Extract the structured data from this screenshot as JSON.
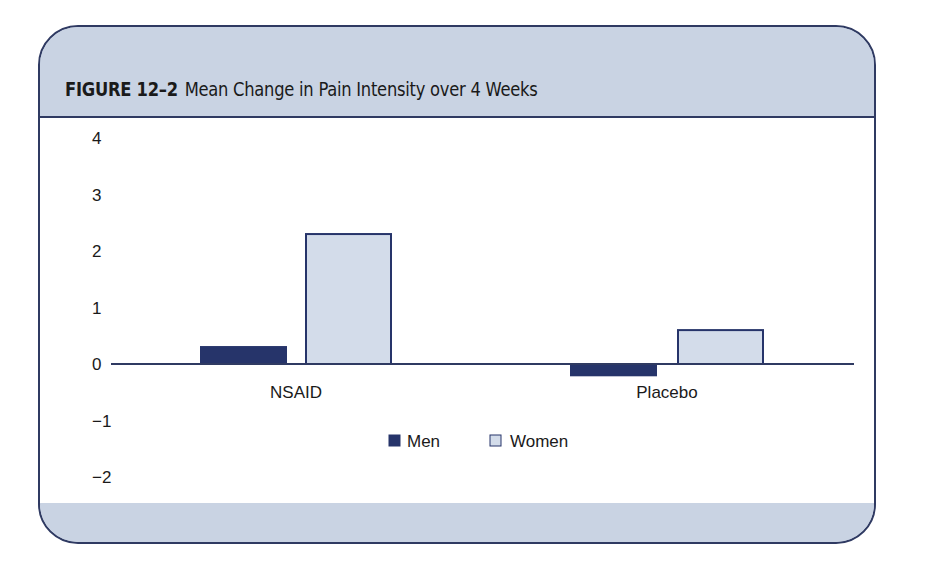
{
  "figure": {
    "label": "FIGURE 12–2",
    "title": "Mean Change in Pain Intensity over 4 Weeks"
  },
  "colors": {
    "frame_border": "#2f3a62",
    "panel_fill": "#c9d3e3",
    "men": "#26346a",
    "women": "#d3dcea",
    "bar_stroke": "#26346a"
  },
  "chart_data": {
    "type": "bar",
    "title": "Mean Change in Pain Intensity over 4 Weeks",
    "xlabel": "",
    "ylabel": "",
    "categories": [
      "NSAID",
      "Placebo"
    ],
    "series": [
      {
        "name": "Men",
        "values": [
          0.3,
          -0.2
        ]
      },
      {
        "name": "Women",
        "values": [
          2.3,
          0.6
        ]
      }
    ],
    "yticks": [
      4,
      3,
      2,
      1,
      0,
      -1,
      -2
    ],
    "ytick_labels": [
      "4",
      "3",
      "2",
      "1",
      "0",
      "−1",
      "−2"
    ],
    "ylim": [
      -2,
      4
    ],
    "grid": false,
    "legend": {
      "position": "bottom-center",
      "entries": [
        "Men",
        "Women"
      ]
    }
  }
}
